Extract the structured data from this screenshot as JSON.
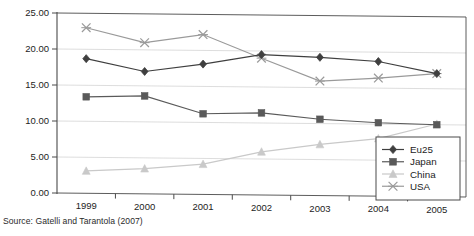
{
  "chart_data": {
    "type": "line",
    "title": "",
    "subtitle": "",
    "xlabel": "",
    "ylabel": "",
    "categories": [
      "1999",
      "2000",
      "2001",
      "2002",
      "2003",
      "2004",
      "2005"
    ],
    "ylim": [
      0.0,
      25.0
    ],
    "ytick_values": [
      0.0,
      5.0,
      10.0,
      15.0,
      20.0,
      25.0
    ],
    "ytick_labels": [
      "0.00",
      "5.00",
      "10.00",
      "15.00",
      "20.00",
      "25.00"
    ],
    "grid": "horizontal",
    "legend_position": "bottom-right",
    "series": [
      {
        "name": "Eu25",
        "marker": "diamond",
        "color": "#3f3f3f",
        "values": [
          18.7,
          17.0,
          18.1,
          19.5,
          19.2,
          18.7,
          17.1
        ]
      },
      {
        "name": "Japan",
        "marker": "square",
        "color": "#5a5a5a",
        "values": [
          13.4,
          13.6,
          11.2,
          11.4,
          10.6,
          10.2,
          10.0
        ]
      },
      {
        "name": "China",
        "marker": "triangle",
        "color": "#c9c9c9",
        "values": [
          3.1,
          3.5,
          4.2,
          6.0,
          7.1,
          8.0,
          10.1
        ]
      },
      {
        "name": "USA",
        "marker": "cross",
        "color": "#9a9a9a",
        "values": [
          23.0,
          21.0,
          22.2,
          19.0,
          15.9,
          16.4,
          17.1
        ]
      }
    ]
  },
  "legend": {
    "entries": [
      {
        "label": "Eu25"
      },
      {
        "label": "Japan"
      },
      {
        "label": "China"
      },
      {
        "label": "USA"
      }
    ]
  },
  "axis": {
    "ytick_labels": [
      "25.00",
      "20.00",
      "15.00",
      "10.00",
      "5.00",
      "0.00"
    ],
    "xtick_labels": [
      "1999",
      "2000",
      "2001",
      "2002",
      "2003",
      "2004",
      "2005"
    ]
  },
  "footer": {
    "source_note": "Source: Gatelli and Tarantola (2007)"
  },
  "colors": {
    "eu25": "#3f3f3f",
    "japan": "#5a5a5a",
    "china": "#c9c9c9",
    "usa": "#9a9a9a",
    "gridline": "#d4d4d4",
    "axis": "#4a4a4a",
    "text": "#1d1d1d"
  }
}
